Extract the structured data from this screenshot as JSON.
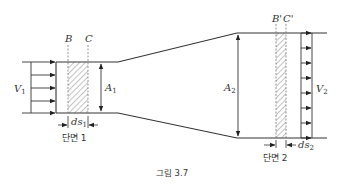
{
  "figure": {
    "caption": "그림 3.7",
    "labels": {
      "B": "B",
      "C": "C",
      "B_prime": "B'",
      "C_prime": "C'",
      "V1": "V",
      "V1_sub": "1",
      "V2": "V",
      "V2_sub": "2",
      "A1": "A",
      "A1_sub": "1",
      "A2": "A",
      "A2_sub": "2",
      "ds1": "ds",
      "ds1_sub": "1",
      "ds2": "ds",
      "ds2_sub": "2",
      "section1": "단면 1",
      "section2": "단면 2"
    },
    "colors": {
      "line": "#333333",
      "hatch": "#555555",
      "dash": "#777777"
    }
  }
}
